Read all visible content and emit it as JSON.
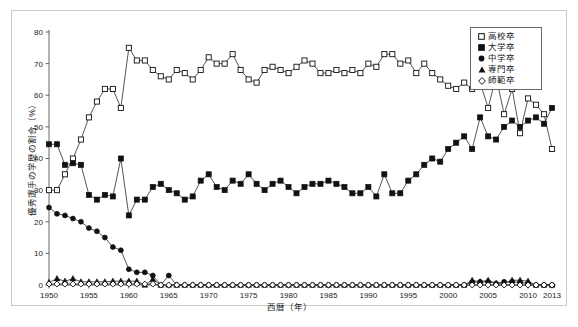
{
  "chart_data": {
    "type": "line",
    "title": "",
    "xlabel": "西暦（年）",
    "ylabel": "優秀選手の学歴の割合（%）",
    "xlim": [
      1950,
      2013
    ],
    "ylim": [
      0,
      80
    ],
    "yticks": [
      0,
      10,
      20,
      30,
      40,
      50,
      60,
      70,
      80
    ],
    "xticks": [
      1950,
      1955,
      1960,
      1965,
      1970,
      1975,
      1980,
      1985,
      1990,
      1995,
      2000,
      2005,
      2010,
      2013
    ],
    "grid": false,
    "legend_position": "upper right",
    "x": [
      1950,
      1951,
      1952,
      1953,
      1954,
      1955,
      1956,
      1957,
      1958,
      1959,
      1960,
      1961,
      1962,
      1963,
      1964,
      1965,
      1966,
      1967,
      1968,
      1969,
      1970,
      1971,
      1972,
      1973,
      1974,
      1975,
      1976,
      1977,
      1978,
      1979,
      1980,
      1981,
      1982,
      1983,
      1984,
      1985,
      1986,
      1987,
      1988,
      1989,
      1990,
      1991,
      1992,
      1993,
      1994,
      1995,
      1996,
      1997,
      1998,
      1999,
      2000,
      2001,
      2002,
      2003,
      2004,
      2005,
      2006,
      2007,
      2008,
      2009,
      2010,
      2011,
      2012,
      2013
    ],
    "series": [
      {
        "name": "高校卒",
        "marker": "open-square",
        "values": [
          30,
          30,
          35,
          40,
          46,
          53,
          58,
          62,
          62,
          56,
          75,
          71,
          71,
          68,
          66,
          65,
          68,
          67,
          65,
          68,
          72,
          70,
          70,
          73,
          68,
          65,
          64,
          68,
          69,
          68,
          67,
          69,
          71,
          70,
          67,
          67,
          68,
          67,
          68,
          67,
          70,
          69,
          73,
          73,
          70,
          71,
          67,
          70,
          67,
          65,
          63,
          62,
          64,
          62,
          64,
          56,
          66,
          54,
          62,
          48,
          59,
          57,
          54,
          43
        ]
      },
      {
        "name": "大学卒",
        "marker": "filled-square",
        "values": [
          44.5,
          44.5,
          38,
          38.5,
          38,
          28.5,
          27,
          28.5,
          28,
          40,
          22,
          27,
          27,
          31,
          32,
          30,
          29,
          27,
          28,
          33,
          35,
          31,
          30,
          33,
          32,
          35,
          32,
          30,
          32,
          33,
          31,
          29,
          31,
          32,
          32,
          33,
          32,
          31,
          29,
          29,
          31,
          28,
          35,
          29,
          29,
          33,
          35,
          38,
          40,
          39,
          43,
          45,
          47,
          43,
          53,
          47,
          46,
          50,
          52,
          50,
          52,
          53,
          51,
          56
        ]
      },
      {
        "name": "中学卒",
        "marker": "filled-circle",
        "values": [
          24.5,
          22.5,
          22,
          21,
          20,
          18,
          17,
          15,
          12,
          11,
          5,
          4,
          4,
          3,
          0,
          3,
          0,
          0,
          0,
          0,
          0,
          0,
          0,
          0,
          0,
          0,
          0,
          0,
          0,
          0,
          0,
          0,
          0,
          0,
          0,
          0,
          0,
          0,
          0,
          0,
          0,
          0,
          0,
          0,
          0,
          0,
          0,
          0,
          0,
          0,
          0,
          0,
          0,
          0.8,
          1,
          1,
          0.5,
          1,
          1,
          0.8,
          0.5,
          0,
          0,
          0
        ]
      },
      {
        "name": "専門卒",
        "marker": "filled-triangle",
        "values": [
          0.8,
          2,
          1.2,
          2,
          1,
          1,
          1,
          1,
          1.2,
          1.2,
          1.2,
          1.2,
          0,
          1.8,
          0,
          0,
          0,
          0,
          0,
          0,
          0,
          0,
          0,
          0,
          0,
          0,
          0,
          0,
          0,
          0,
          0,
          0,
          0,
          0,
          0,
          0,
          0,
          0,
          0,
          0,
          0,
          0,
          0,
          0,
          0,
          0,
          0,
          0,
          0,
          0,
          0,
          0,
          0,
          1.5,
          1,
          1.5,
          0.5,
          0.5,
          1.5,
          1.5,
          1.2,
          0,
          0,
          0
        ]
      },
      {
        "name": "師範卒",
        "marker": "open-diamond",
        "values": [
          0.3,
          0.3,
          0.3,
          0.3,
          0.3,
          0.3,
          0.3,
          0.3,
          0.3,
          0.3,
          0.3,
          0.3,
          0.3,
          0.3,
          0,
          0,
          0,
          0,
          0,
          0,
          0,
          0,
          0,
          0,
          0,
          0,
          0,
          0,
          0,
          0,
          0,
          0,
          0,
          0,
          0,
          0,
          0,
          0,
          0,
          0,
          0,
          0,
          0,
          0,
          0,
          0,
          0,
          0,
          0,
          0,
          0,
          0,
          0,
          0,
          0,
          0,
          0,
          0,
          0,
          0,
          0,
          0,
          0,
          0
        ]
      }
    ]
  },
  "legend": {
    "items": [
      {
        "label": "高校卒",
        "marker": "open-square"
      },
      {
        "label": "大学卒",
        "marker": "filled-square"
      },
      {
        "label": "中学卒",
        "marker": "filled-circle"
      },
      {
        "label": "専門卒",
        "marker": "filled-triangle"
      },
      {
        "label": "師範卒",
        "marker": "open-diamond"
      }
    ]
  },
  "colors": {
    "line": "#2a2a2a",
    "marker_fill": "#111111",
    "marker_open": "#ffffff",
    "axis": "#555555",
    "frame": "#c9c9c9",
    "text": "#1a1a1a"
  }
}
